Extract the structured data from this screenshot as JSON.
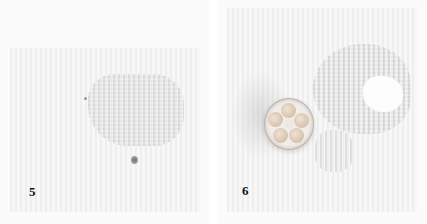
{
  "panels": [
    {
      "label": "5",
      "description": "Textured paper with rounded rectangular cutout region and small dark dot below"
    },
    {
      "label": "6",
      "description": "Flower-shaped punch tool placed beside textured paper showing a flower-shaped cutout"
    }
  ]
}
